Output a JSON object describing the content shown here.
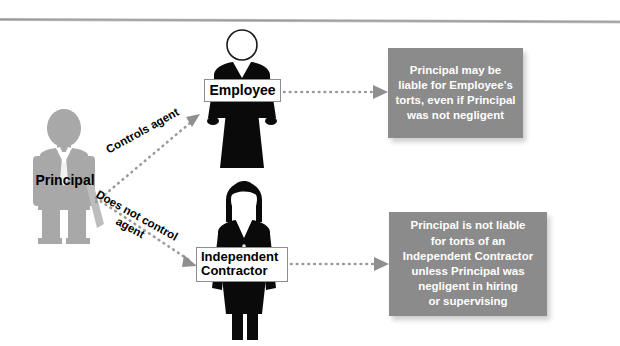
{
  "diagram": {
    "title_rule": "horizontal-divider",
    "colors": {
      "statement_box_fill": "#8b8b8b",
      "statement_box_text": "#ffffff",
      "principal_figure": "#a8a8a8",
      "agent_figure": "#000000",
      "connector": "#9a9a9a",
      "divider": "#9b9b9f"
    }
  },
  "principal": {
    "label": "Principal"
  },
  "employee": {
    "label": "Employee"
  },
  "contractor": {
    "label_line1": "Independent",
    "label_line2": "Contractor"
  },
  "connectors": {
    "controls": {
      "label": "Controls agent"
    },
    "no_control": {
      "label_line1": "Does not control",
      "label_line2": "agent"
    }
  },
  "statements": {
    "employee": {
      "lines": [
        "Principal may be",
        "liable for Employee's",
        "torts, even if Principal",
        "was not negligent"
      ]
    },
    "contractor": {
      "lines": [
        "Principal is not liable",
        "for torts of an",
        "Independent Contractor",
        "unless Principal was",
        "negligent in hiring",
        "or supervising"
      ]
    }
  }
}
